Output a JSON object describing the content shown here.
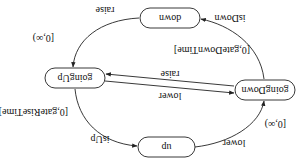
{
  "diagram": {
    "orientation": "rotated-180",
    "states": {
      "up": "up",
      "goingDown": "goingDown",
      "down": "down",
      "goingUp": "goingUp"
    },
    "edges": {
      "up_to_goingDown": {
        "action": "lower",
        "guard": "[0,∞)"
      },
      "goingDown_to_down": {
        "action": "isDown",
        "guard": "[0,gateDownTime]"
      },
      "down_to_goingUp": {
        "action": "raise",
        "guard": "[0,∞)"
      },
      "goingUp_to_up": {
        "action": "isUp",
        "guard": "[0,gateRiseTime]"
      },
      "goingUp_to_goingDown": {
        "action": "lower"
      },
      "goingDown_to_goingUp": {
        "action": "raise"
      }
    }
  }
}
